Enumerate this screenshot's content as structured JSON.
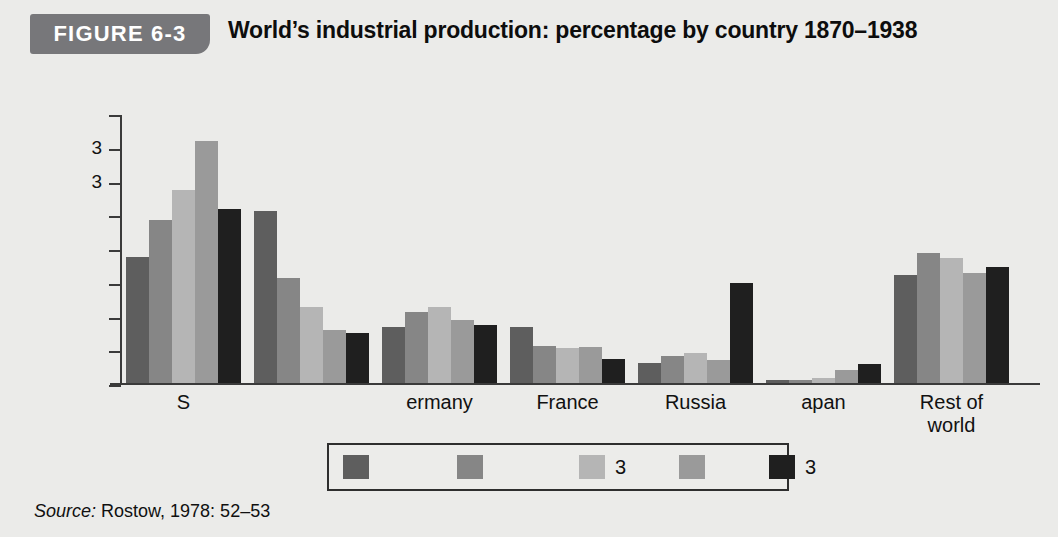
{
  "header": {
    "badge_label": "FIGURE 6-3",
    "title": "World’s industrial production: percentage by country 1870–1938"
  },
  "source": {
    "prefix": "Source:",
    "text": " Rostow, 1978: 52–53"
  },
  "colors": {
    "background": "#ebebe9",
    "badge": "#77777a",
    "axis": "#3a3a3a",
    "series": [
      "#5e5e5e",
      "#868686",
      "#b5b5b5",
      "#9a9a9a",
      "#1f1f1f"
    ],
    "legend_border": "#2e2e2e"
  },
  "legend": {
    "items": [
      {
        "label": "",
        "color": "#5e5e5e"
      },
      {
        "label": "",
        "color": "#868686"
      },
      {
        "label": "3",
        "color": "#b5b5b5"
      },
      {
        "label": "",
        "color": "#9a9a9a"
      },
      {
        "label": "3",
        "color": "#1f1f1f"
      }
    ]
  },
  "chart_data": {
    "type": "bar",
    "title": "World’s industrial production: percentage by country 1870–1938",
    "xlabel": "",
    "ylabel": "",
    "grid": false,
    "legend_position": "bottom",
    "ylim": [
      0,
      50
    ],
    "ytick_labels": [
      "",
      "3",
      "3",
      "",
      "",
      "",
      "",
      "",
      ""
    ],
    "categories": [
      "S",
      "",
      "ermany",
      "France",
      "Russia",
      "apan",
      "Rest of\nworld"
    ],
    "series": [
      {
        "name": "",
        "color": "#5e5e5e",
        "values": [
          23.3,
          31.8,
          10.3,
          10.3,
          3.7,
          0.6,
          20.0
        ]
      },
      {
        "name": "",
        "color": "#868686",
        "values": [
          30.1,
          19.5,
          13.2,
          6.8,
          5.0,
          0.6,
          24.0
        ]
      },
      {
        "name": "3",
        "color": "#b5b5b5",
        "values": [
          35.8,
          14.0,
          14.1,
          6.4,
          5.5,
          1.0,
          23.2
        ]
      },
      {
        "name": "",
        "color": "#9a9a9a",
        "values": [
          44.8,
          9.9,
          11.6,
          6.6,
          4.3,
          2.5,
          20.4
        ]
      },
      {
        "name": "3",
        "color": "#1f1f1f",
        "values": [
          32.2,
          9.2,
          10.7,
          4.4,
          18.5,
          3.5,
          21.5
        ]
      }
    ]
  }
}
